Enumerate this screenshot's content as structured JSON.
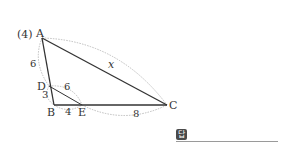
{
  "problem": {
    "number_label": "(4)",
    "answer_badge": "답"
  },
  "points": {
    "A": {
      "label": "A",
      "x": 42,
      "y": 38
    },
    "B": {
      "label": "B",
      "x": 54,
      "y": 105
    },
    "C": {
      "label": "C",
      "x": 167,
      "y": 105
    },
    "D": {
      "label": "D",
      "x": 49,
      "y": 86
    },
    "E": {
      "label": "E",
      "x": 82,
      "y": 105
    }
  },
  "lengths": {
    "AD": "6",
    "DB": "3",
    "DE": "6",
    "BE": "4",
    "EC": "8",
    "AC": "x"
  },
  "colors": {
    "segment": "#333333",
    "arc": "#b5b5b5",
    "badge": "#4a4a4a"
  }
}
